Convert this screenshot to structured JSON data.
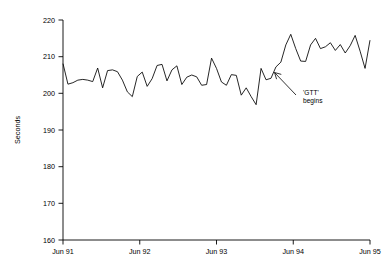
{
  "chart_data": {
    "type": "line",
    "title": "",
    "xlabel": "",
    "ylabel": "Seconds",
    "ylim": [
      160,
      220
    ],
    "yticks": [
      160,
      170,
      180,
      190,
      200,
      210,
      220
    ],
    "ytick_labels": [
      "160",
      "170",
      "180",
      "190",
      "200",
      "210",
      "220"
    ],
    "xtick_labels": [
      "Jun 91",
      "Jun 92",
      "Jun 93",
      "Jun 94",
      "Jun 95"
    ],
    "xtick_values": [
      0,
      12,
      24,
      36,
      48
    ],
    "xlim": [
      0,
      48
    ],
    "grid": false,
    "legend": "none",
    "annotations": [
      {
        "text_line_1": "'GTT'",
        "text_line_2": "begins",
        "arrow_from_x": 37.5,
        "arrow_from_y": 195.0,
        "arrow_to_x": 33.2,
        "arrow_to_y": 200.3
      }
    ],
    "series": [
      {
        "name": "Seconds",
        "x": [
          0,
          1,
          2,
          3,
          4,
          5,
          6,
          7,
          8,
          9,
          10,
          11,
          12,
          13,
          14,
          15,
          16,
          17,
          18,
          19,
          20,
          21,
          22,
          23,
          24,
          25,
          26,
          27,
          28,
          29,
          30,
          31,
          32,
          33,
          34,
          35,
          36,
          37,
          38,
          39,
          40,
          41,
          42,
          43,
          44,
          45,
          46,
          47,
          48
        ],
        "values": [
          208.1,
          202.5,
          202.9,
          203.6,
          203.8,
          203.6,
          203.2,
          206.9,
          201.5,
          206.2,
          206.4,
          205.9,
          203.6,
          200.4,
          199.1,
          204.6,
          205.8,
          201.9,
          204.0,
          207.6,
          207.9,
          203.4,
          206.4,
          207.5,
          202.4,
          204.4,
          205.0,
          204.5,
          202.2,
          202.4,
          209.6,
          206.8,
          203.1,
          202.2,
          205.1,
          204.9,
          199.5,
          201.5,
          199.1,
          196.9,
          206.8,
          203.7,
          204.1,
          207.2,
          208.5,
          213.2,
          216.1,
          212.2,
          208.8
        ],
        "values_tail": [
          208.7,
          213.2,
          215.0,
          212.2,
          212.7,
          213.8,
          211.7,
          213.3,
          211.0,
          213.0,
          215.8,
          211.5,
          206.8,
          214.5
        ]
      }
    ],
    "x_note": "monthly observations from Jun 91 to Jun 95"
  },
  "axis": {
    "y_title": "Seconds"
  }
}
